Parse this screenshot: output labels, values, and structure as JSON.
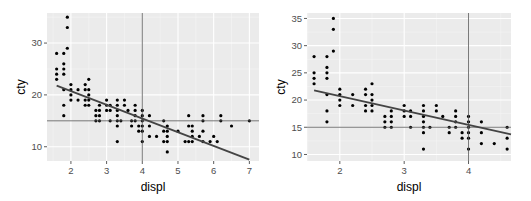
{
  "chart_data": [
    {
      "type": "scatter",
      "title": "",
      "xlabel": "displ",
      "ylabel": "cty",
      "xlim": [
        1.33,
        7.27
      ],
      "ylim": [
        7.25,
        35.8
      ],
      "xticks": [
        2,
        3,
        4,
        5,
        6,
        7
      ],
      "yticks": [
        10,
        20,
        30
      ],
      "grid": true,
      "reference_lines": {
        "vline_x": 4,
        "hline_y": 15
      },
      "trend_line": {
        "x": [
          1.6,
          7.0
        ],
        "y": [
          21.8,
          7.5
        ]
      },
      "points": [
        [
          1.6,
          28
        ],
        [
          1.6,
          25
        ],
        [
          1.6,
          24
        ],
        [
          1.6,
          23
        ],
        [
          1.8,
          28
        ],
        [
          1.8,
          26
        ],
        [
          1.8,
          25
        ],
        [
          1.8,
          24
        ],
        [
          1.8,
          21
        ],
        [
          1.8,
          18
        ],
        [
          1.8,
          16
        ],
        [
          1.9,
          35
        ],
        [
          1.9,
          33
        ],
        [
          1.9,
          29
        ],
        [
          2.0,
          22
        ],
        [
          2.0,
          21
        ],
        [
          2.0,
          20
        ],
        [
          2.0,
          19
        ],
        [
          2.2,
          21
        ],
        [
          2.2,
          19
        ],
        [
          2.4,
          22
        ],
        [
          2.4,
          21
        ],
        [
          2.4,
          19
        ],
        [
          2.4,
          18
        ],
        [
          2.5,
          23
        ],
        [
          2.5,
          21
        ],
        [
          2.5,
          20
        ],
        [
          2.5,
          19
        ],
        [
          2.5,
          18
        ],
        [
          2.7,
          17
        ],
        [
          2.7,
          16
        ],
        [
          2.7,
          15
        ],
        [
          2.8,
          18
        ],
        [
          2.8,
          17
        ],
        [
          2.8,
          16
        ],
        [
          2.8,
          15
        ],
        [
          3.0,
          19
        ],
        [
          3.0,
          18
        ],
        [
          3.0,
          17
        ],
        [
          3.1,
          18
        ],
        [
          3.1,
          17
        ],
        [
          3.1,
          15
        ],
        [
          3.3,
          19
        ],
        [
          3.3,
          18
        ],
        [
          3.3,
          17
        ],
        [
          3.3,
          16
        ],
        [
          3.3,
          15
        ],
        [
          3.3,
          14
        ],
        [
          3.3,
          11
        ],
        [
          3.4,
          15
        ],
        [
          3.5,
          19
        ],
        [
          3.5,
          18
        ],
        [
          3.6,
          17
        ],
        [
          3.7,
          15
        ],
        [
          3.7,
          14
        ],
        [
          3.8,
          18
        ],
        [
          3.8,
          17
        ],
        [
          3.8,
          16
        ],
        [
          3.8,
          15
        ],
        [
          3.9,
          14
        ],
        [
          3.9,
          13
        ],
        [
          4.0,
          17
        ],
        [
          4.0,
          16
        ],
        [
          4.0,
          15
        ],
        [
          4.0,
          14
        ],
        [
          4.0,
          13
        ],
        [
          4.0,
          11
        ],
        [
          4.2,
          16
        ],
        [
          4.2,
          14
        ],
        [
          4.2,
          12
        ],
        [
          4.4,
          12
        ],
        [
          4.6,
          15
        ],
        [
          4.6,
          13
        ],
        [
          4.6,
          11
        ],
        [
          4.7,
          14
        ],
        [
          4.7,
          13
        ],
        [
          4.7,
          12
        ],
        [
          4.7,
          11
        ],
        [
          4.7,
          9
        ],
        [
          5.0,
          13
        ],
        [
          5.2,
          11
        ],
        [
          5.3,
          16
        ],
        [
          5.3,
          14
        ],
        [
          5.3,
          11
        ],
        [
          5.4,
          14
        ],
        [
          5.4,
          13
        ],
        [
          5.4,
          12
        ],
        [
          5.4,
          11
        ],
        [
          5.6,
          12
        ],
        [
          5.7,
          16
        ],
        [
          5.7,
          15
        ],
        [
          5.7,
          13
        ],
        [
          5.7,
          11
        ],
        [
          5.9,
          11
        ],
        [
          6.0,
          12
        ],
        [
          6.1,
          11
        ],
        [
          6.2,
          16
        ],
        [
          6.2,
          15
        ],
        [
          6.5,
          14
        ],
        [
          7.0,
          15
        ]
      ],
      "panel": {
        "x": 47,
        "y": 13,
        "w": 212,
        "h": 148
      }
    },
    {
      "type": "scatter",
      "title": "",
      "xlabel": "displ",
      "ylabel": "cty",
      "xlim": [
        1.49,
        4.66
      ],
      "ylim": [
        8.8,
        36.0
      ],
      "xticks": [
        2,
        3,
        4
      ],
      "yticks": [
        10,
        15,
        20,
        25,
        30,
        35
      ],
      "grid": true,
      "reference_lines": {
        "vline_x": 4,
        "hline_y": 15
      },
      "trend_line": {
        "x": [
          1.6,
          4.66
        ],
        "y": [
          21.8,
          13.7
        ]
      },
      "points": [
        [
          1.6,
          28
        ],
        [
          1.6,
          25
        ],
        [
          1.6,
          24
        ],
        [
          1.6,
          23
        ],
        [
          1.8,
          28
        ],
        [
          1.8,
          26
        ],
        [
          1.8,
          25
        ],
        [
          1.8,
          24
        ],
        [
          1.8,
          21
        ],
        [
          1.8,
          18
        ],
        [
          1.8,
          16
        ],
        [
          1.9,
          35
        ],
        [
          1.9,
          33
        ],
        [
          1.9,
          29
        ],
        [
          2.0,
          22
        ],
        [
          2.0,
          21
        ],
        [
          2.0,
          20
        ],
        [
          2.0,
          19
        ],
        [
          2.2,
          21
        ],
        [
          2.2,
          19
        ],
        [
          2.4,
          22
        ],
        [
          2.4,
          21
        ],
        [
          2.4,
          19
        ],
        [
          2.4,
          18
        ],
        [
          2.5,
          23
        ],
        [
          2.5,
          21
        ],
        [
          2.5,
          20
        ],
        [
          2.5,
          19
        ],
        [
          2.5,
          18
        ],
        [
          2.7,
          17
        ],
        [
          2.7,
          16
        ],
        [
          2.7,
          15
        ],
        [
          2.8,
          18
        ],
        [
          2.8,
          17
        ],
        [
          2.8,
          16
        ],
        [
          2.8,
          15
        ],
        [
          3.0,
          19
        ],
        [
          3.0,
          18
        ],
        [
          3.0,
          17
        ],
        [
          3.1,
          18
        ],
        [
          3.1,
          17
        ],
        [
          3.1,
          15
        ],
        [
          3.3,
          19
        ],
        [
          3.3,
          18
        ],
        [
          3.3,
          17
        ],
        [
          3.3,
          16
        ],
        [
          3.3,
          15
        ],
        [
          3.3,
          14
        ],
        [
          3.3,
          11
        ],
        [
          3.4,
          15
        ],
        [
          3.5,
          19
        ],
        [
          3.5,
          18
        ],
        [
          3.6,
          17
        ],
        [
          3.7,
          15
        ],
        [
          3.7,
          14
        ],
        [
          3.8,
          18
        ],
        [
          3.8,
          17
        ],
        [
          3.8,
          16
        ],
        [
          3.8,
          15
        ],
        [
          3.9,
          14
        ],
        [
          3.9,
          13
        ],
        [
          4.0,
          17
        ],
        [
          4.0,
          16
        ],
        [
          4.0,
          15
        ],
        [
          4.0,
          14
        ],
        [
          4.0,
          13
        ],
        [
          4.0,
          11
        ],
        [
          4.2,
          16
        ],
        [
          4.2,
          14
        ],
        [
          4.2,
          12
        ],
        [
          4.4,
          12
        ],
        [
          4.6,
          15
        ],
        [
          4.6,
          13
        ],
        [
          4.6,
          11
        ]
      ],
      "panel": {
        "x": 307,
        "y": 13,
        "w": 204,
        "h": 148
      }
    }
  ],
  "colors": {
    "panel_bg": "#ebebeb",
    "grid_major": "#ffffff",
    "grid_minor": "#f5f5f5",
    "point": "#000000",
    "ref_line": "#555555",
    "trend_line": "#444444",
    "tick_text": "#4d4d4d",
    "axis_title": "#000000"
  }
}
